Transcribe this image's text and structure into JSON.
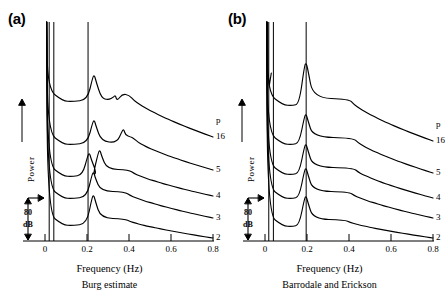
{
  "figure": {
    "ylabel": "Power",
    "xlabel": "Frequency (Hz)",
    "scalebar_value": "80",
    "scalebar_unit": "dB",
    "order_header": "p",
    "ink": "#000000"
  },
  "panels": [
    {
      "label": "(a)",
      "caption": "Burg estimate",
      "xlabel": "Frequency (Hz)",
      "ylabel": "Power",
      "order_header": "p",
      "scalebar_value": "80",
      "scalebar_unit": "dB",
      "xticks": [
        "0",
        "0.2",
        "0.4",
        "0.6",
        "0.8"
      ],
      "xtickvals": [
        0,
        0.2,
        0.4,
        0.6,
        0.8
      ],
      "order_labels": [
        "16",
        "5",
        "4",
        "3",
        "2"
      ],
      "ref_lines": [
        0.02,
        0.042,
        0.205
      ],
      "curves": [
        {
          "p": "16",
          "baseline": 103,
          "peaks": [
            {
              "f": 0.235,
              "h": 26
            },
            {
              "f": 0.335,
              "h": 6
            }
          ],
          "tail_start": 0.4,
          "tail_end_y": 137,
          "shoulder": 0.085
        },
        {
          "p": "5",
          "baseline": 146,
          "peaks": [
            {
              "f": 0.235,
              "h": 24
            },
            {
              "f": 0.375,
              "h": 15
            }
          ],
          "tail_start": 0.42,
          "tail_end_y": 170,
          "shoulder": 0.085
        },
        {
          "p": "4",
          "baseline": 178,
          "peaks": [
            {
              "f": 0.212,
              "h": 23
            },
            {
              "f": 0.262,
              "h": 26
            }
          ],
          "tail_start": 0.4,
          "tail_end_y": 196,
          "shoulder": 0.085
        },
        {
          "p": "3",
          "baseline": 200,
          "peaks": [
            {
              "f": 0.232,
              "h": 26
            }
          ],
          "tail_start": 0.38,
          "tail_end_y": 218,
          "shoulder": 0.085
        },
        {
          "p": "2",
          "baseline": 227,
          "peaks": [
            {
              "f": 0.232,
              "h": 30
            }
          ],
          "tail_start": 0.38,
          "tail_end_y": 238,
          "shoulder": 0.085
        }
      ]
    },
    {
      "label": "(b)",
      "caption": "Barrodale and Erickson",
      "xlabel": "Frequency (Hz)",
      "ylabel": "Power",
      "order_header": "p",
      "scalebar_value": "80",
      "scalebar_unit": "dB",
      "xticks": [
        "0",
        "0.2",
        "0.4",
        "0.6",
        "0.8"
      ],
      "xtickvals": [
        0,
        0.2,
        0.4,
        0.6,
        0.8
      ],
      "order_labels": [
        "16",
        "5",
        "4",
        "3",
        "2"
      ],
      "ref_lines": [
        0.018,
        0.04,
        0.196
      ],
      "curves": [
        {
          "p": "16",
          "baseline": 107,
          "edge_spike": true,
          "peaks": [
            {
              "f": 0.196,
              "h": 42
            }
          ],
          "tail_start": 0.4,
          "tail_end_y": 141,
          "shoulder": 0.085
        },
        {
          "p": "5",
          "baseline": 146,
          "peaks": [
            {
              "f": 0.196,
              "h": 30
            }
          ],
          "tail_start": 0.42,
          "tail_end_y": 173,
          "shoulder": 0.085
        },
        {
          "p": "4",
          "baseline": 176,
          "peaks": [
            {
              "f": 0.196,
              "h": 30
            }
          ],
          "tail_start": 0.42,
          "tail_end_y": 198,
          "shoulder": 0.085
        },
        {
          "p": "3",
          "baseline": 200,
          "peaks": [
            {
              "f": 0.196,
              "h": 30
            }
          ],
          "tail_start": 0.4,
          "tail_end_y": 218,
          "shoulder": 0.085
        },
        {
          "p": "2",
          "baseline": 228,
          "peaks": [
            {
              "f": 0.196,
              "h": 30
            }
          ],
          "tail_start": 0.38,
          "tail_end_y": 238,
          "shoulder": 0.085
        }
      ]
    }
  ],
  "chart_data": {
    "type": "line",
    "title": "",
    "xlabel": "Frequency (Hz)",
    "ylabel": "Power",
    "xlim": [
      0,
      0.8
    ],
    "grid": false,
    "legend": "right-edge order labels",
    "panels": [
      {
        "name": "Burg estimate",
        "label": "(a)",
        "series": [
          {
            "name": "p = 16",
            "peak_frequencies_hz": [
              0.235,
              0.335
            ],
            "relative_peak_db": [
              26,
              6
            ],
            "shape": "broad shelf 0-0.2, main peak 0.235, slow roll-off to 0.8"
          },
          {
            "name": "p = 5",
            "peak_frequencies_hz": [
              0.235,
              0.375
            ],
            "relative_peak_db": [
              24,
              15
            ],
            "shape": "main peak 0.235 plus secondary bump 0.375"
          },
          {
            "name": "p = 4",
            "peak_frequencies_hz": [
              0.212,
              0.262
            ],
            "relative_peak_db": [
              23,
              26
            ],
            "shape": "split doublet around 0.21 and 0.26"
          },
          {
            "name": "p = 3",
            "peak_frequencies_hz": [
              0.232
            ],
            "relative_peak_db": [
              26
            ],
            "shape": "single peak, smooth decay"
          },
          {
            "name": "p = 2",
            "peak_frequencies_hz": [
              0.232
            ],
            "relative_peak_db": [
              30
            ],
            "shape": "single broad peak, smooth decay"
          }
        ]
      },
      {
        "name": "Barrodale and Erickson",
        "label": "(b)",
        "series": [
          {
            "name": "p = 16",
            "peak_frequencies_hz": [
              0.02,
              0.196
            ],
            "relative_peak_db": [
              50,
              42
            ],
            "shape": "high value at zero frequency, sharp line at 0.196"
          },
          {
            "name": "p = 5",
            "peak_frequencies_hz": [
              0.196
            ],
            "relative_peak_db": [
              30
            ],
            "shape": "sharp single line at 0.196"
          },
          {
            "name": "p = 4",
            "peak_frequencies_hz": [
              0.196
            ],
            "relative_peak_db": [
              30
            ],
            "shape": "sharp single line at 0.196"
          },
          {
            "name": "p = 3",
            "peak_frequencies_hz": [
              0.196
            ],
            "relative_peak_db": [
              30
            ],
            "shape": "sharp single line at 0.196"
          },
          {
            "name": "p = 2",
            "peak_frequencies_hz": [
              0.196
            ],
            "relative_peak_db": [
              30
            ],
            "shape": "sharp single line at 0.196"
          }
        ]
      }
    ],
    "xticks": [
      0,
      0.2,
      0.4,
      0.6,
      0.8
    ],
    "xticklabels": [
      "0",
      "0.2",
      "0.4",
      "0.6",
      "0.8"
    ],
    "scale_bar": {
      "value": 80,
      "unit": "dB",
      "axis": "y"
    },
    "model_orders": [
      16,
      5,
      4,
      3,
      2
    ]
  }
}
